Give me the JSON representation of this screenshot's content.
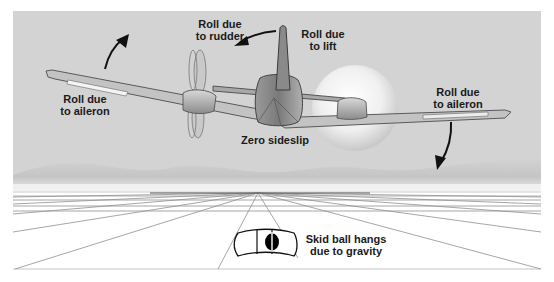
{
  "diagram": {
    "colors": {
      "sky": "#d3d3d3",
      "ground": "#ffffff",
      "airframe_light": "#c8c8c8",
      "airframe_dark": "#6e6e6e",
      "arrow": "#111111",
      "grid_line": "#9a9a9a",
      "skid_ball": "#000000"
    },
    "labels": {
      "roll_rudder": [
        "Roll due",
        "to rudder"
      ],
      "roll_lift": [
        "Roll due",
        "to lift"
      ],
      "roll_aileron_left": [
        "Roll due",
        "to aileron"
      ],
      "roll_aileron_right": [
        "Roll due",
        "to aileron"
      ],
      "zero_sideslip": "Zero sideslip",
      "skid_ball": [
        "Skid ball hangs",
        "due to gravity"
      ]
    }
  }
}
